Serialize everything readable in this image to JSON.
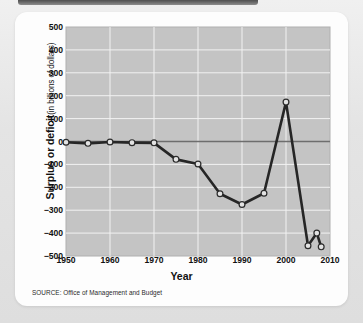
{
  "source_note": "SOURCE: Office of Management and Budget",
  "axis": {
    "y_title_main": "Surplus or deficit",
    "y_title_sub": "(in billions of dollars)",
    "x_title": "Year"
  },
  "colors": {
    "plot_background": "#c4c4c4",
    "gridline": "#f2f2f2",
    "zero_line": "#6e6e6e",
    "series_line": "#262626",
    "marker_fill": "#e3e3e3",
    "marker_stroke": "#2b2b2b",
    "card_background": "#fdfdfd",
    "page_background": "#e9e9e9"
  },
  "chart_data": {
    "type": "line",
    "title": "",
    "xlabel": "Year",
    "ylabel": "Surplus or deficit (in billions of dollars)",
    "xlim": [
      1950,
      2010
    ],
    "ylim": [
      -500,
      500
    ],
    "xticks": [
      1950,
      1960,
      1970,
      1980,
      1990,
      2000,
      2010
    ],
    "xtick_labels": [
      "1950",
      "1960",
      "1970",
      "1980",
      "1990",
      "2000",
      "2010"
    ],
    "yticks": [
      500,
      400,
      300,
      200,
      100,
      0,
      -100,
      -200,
      -300,
      -400,
      -500
    ],
    "ytick_labels": [
      "500",
      "400",
      "300",
      "200",
      "100",
      "0",
      "−100",
      "−200",
      "−300",
      "−400",
      "−500"
    ],
    "grid": true,
    "legend": false,
    "zero_line": 0,
    "x": [
      1950,
      1955,
      1960,
      1965,
      1970,
      1975,
      1980,
      1985,
      1990,
      1995,
      2000,
      2005,
      2007,
      2008
    ],
    "values": [
      -3,
      -8,
      -2,
      -5,
      -6,
      -78,
      -98,
      -228,
      -275,
      -226,
      172,
      -455,
      -400,
      -460
    ],
    "series": [
      {
        "name": "Federal surplus or deficit",
        "values": [
          -3,
          -8,
          -2,
          -5,
          -6,
          -78,
          -98,
          -228,
          -275,
          -226,
          172,
          -455,
          -400,
          -460
        ]
      }
    ]
  }
}
